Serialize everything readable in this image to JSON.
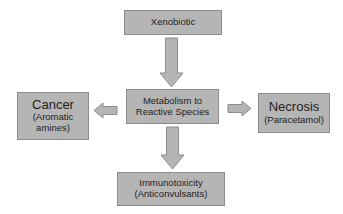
{
  "diagram": {
    "nodes": {
      "xenobiotic": {
        "label": "Xenobiotic"
      },
      "metabolism": {
        "line1": "Metabolism to",
        "line2": "Reactive Species"
      },
      "cancer": {
        "title": "Cancer",
        "sub1": "(Aromatic",
        "sub2": "amines)"
      },
      "necrosis": {
        "title": "Necrosis",
        "sub": "(Paracetamol)"
      },
      "immunotoxicity": {
        "line1": "Immunotoxicity",
        "line2": "(Anticonvulsants)"
      }
    },
    "edges": [
      {
        "from": "xenobiotic",
        "to": "metabolism",
        "direction": "down"
      },
      {
        "from": "metabolism",
        "to": "cancer",
        "direction": "left"
      },
      {
        "from": "metabolism",
        "to": "necrosis",
        "direction": "right"
      },
      {
        "from": "metabolism",
        "to": "immunotoxicity",
        "direction": "down"
      }
    ],
    "colors": {
      "box_fill": "#b5b5b5",
      "box_border": "#8c8c8c",
      "arrow_fill": "#b5b5b5",
      "arrow_stroke": "#8c8c8c"
    }
  }
}
